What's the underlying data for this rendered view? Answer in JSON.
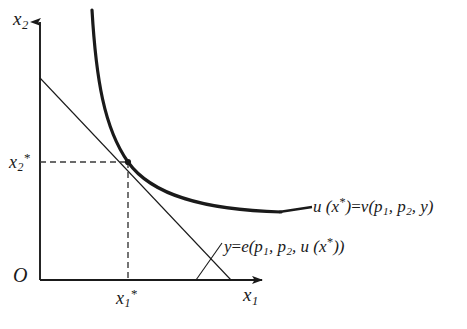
{
  "figure": {
    "background_color": "#ffffff",
    "ink_color": "#1a1a1a"
  },
  "axes": {
    "y_axis_label": "x",
    "y_axis_subscript": "2",
    "x_axis_label": "x",
    "x_axis_subscript": "1",
    "origin_label": "O",
    "origin_px": {
      "x": 40,
      "y": 280
    },
    "x_axis_end_px": {
      "x": 268,
      "y": 280
    },
    "y_axis_top_px": {
      "x": 40,
      "y": 16
    }
  },
  "ticks": {
    "y_tick": {
      "label": "x",
      "subscript": "2",
      "star": "*",
      "value_px_y": 162
    },
    "x_tick": {
      "label": "x",
      "subscript": "1",
      "star": "*",
      "value_px_x": 128
    }
  },
  "curves": {
    "indifference_curve": {
      "name": "indifference-curve",
      "stroke_width": 3.2,
      "path": "M 92,10 C 96,78 104,128 128,162 C 152,196 206,210 281,212"
    },
    "budget_line": {
      "name": "budget-line",
      "stroke_width": 1.1,
      "from_px": {
        "x": 40,
        "y": 78
      },
      "to_px": {
        "x": 231,
        "y": 280
      }
    },
    "tangency_point": {
      "x": 128,
      "y": 162
    }
  },
  "dashed_guides": {
    "horizontal": {
      "from_x": 40,
      "to_x": 128,
      "y": 162
    },
    "vertical": {
      "x": 128,
      "from_y": 162,
      "to_y": 280
    },
    "dash_pattern": "6 4"
  },
  "annotations": {
    "utility_equation": {
      "lhs_fn": "u",
      "lhs_arg": "(x",
      "lhs_star": "*",
      "lhs_close": ")",
      "equals": "=",
      "rhs_fn": "v",
      "rhs_open": "(p",
      "rhs_sub1": "1",
      "rhs_comma1": ", p",
      "rhs_sub2": "2",
      "rhs_comma2": ", y",
      "rhs_close": ")",
      "full_text": "u (x*)=v(p1, p2, y)",
      "leader_line": {
        "from_x": 281,
        "from_y": 212,
        "to_x": 310,
        "to_y": 208
      }
    },
    "expenditure_equation": {
      "lhs": "y",
      "equals": "=",
      "fn": "e",
      "open": "(p",
      "sub1": "1",
      "comma1": ", p",
      "sub2": "2",
      "comma2": ", u (x",
      "star": "*",
      "close": "))",
      "full_text": "y=e(p1, p2, u (x*))"
    }
  }
}
